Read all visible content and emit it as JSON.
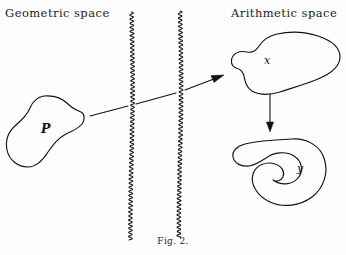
{
  "figure": {
    "caption": "Fig. 2.",
    "headings": {
      "left": "Geometric space",
      "right": "Arithmetic space"
    },
    "colors": {
      "ink": "#121212",
      "paper": "#fefefe"
    },
    "panels": [
      {
        "id": "geometric-space",
        "heading": "Geometric space",
        "objects": [
          {
            "name": "blob-P",
            "label": "P",
            "shape": "closed-irregular-blob"
          }
        ]
      },
      {
        "id": "arithmetic-space",
        "heading": "Arithmetic space",
        "objects": [
          {
            "name": "blob-x",
            "label": "x",
            "shape": "closed-irregular-blob"
          },
          {
            "name": "blob-y",
            "label": "y",
            "shape": "closed-spiral-kidney-blob"
          }
        ]
      }
    ],
    "dividers": [
      {
        "name": "wavy-divider-left",
        "style": "vertical-wavy-line"
      },
      {
        "name": "wavy-divider-right",
        "style": "vertical-wavy-line"
      }
    ],
    "arrows": [
      {
        "name": "arrow-P-to-x",
        "from": "blob-P",
        "to": "blob-x",
        "direction": "right-up"
      },
      {
        "name": "arrow-x-to-y",
        "from": "blob-x",
        "to": "blob-y",
        "direction": "down"
      }
    ],
    "labels": {
      "P": "P",
      "x": "x",
      "y": "y"
    }
  }
}
